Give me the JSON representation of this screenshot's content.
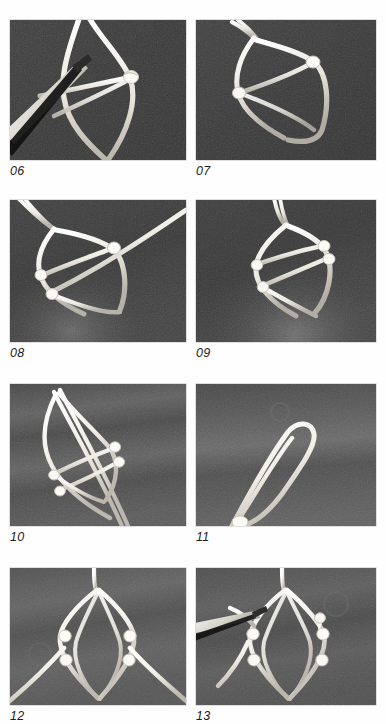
{
  "plate": {
    "kind": "photographic-instruction-plate",
    "layout": "2 columns x 4 rows",
    "background_color": "#ffffff",
    "caption_color": "#1c1c1c",
    "panel_border_color": "#2a2a2a"
  },
  "figures": [
    {
      "caption": "06",
      "row": 1,
      "column": "left",
      "background_tone": "#3a3a3a",
      "cord_color": "#f2f0ea",
      "description": "white cord formed into a pointed leaf loop, a pair of dark tweezers entering from lower left holding a strand, single knot at right side",
      "has_tool": true,
      "knot_count": 1
    },
    {
      "caption": "07",
      "row": 1,
      "column": "right",
      "background_tone": "#3c3c3c",
      "cord_color": "#efece4",
      "description": "leaf shaped cord loop with a diagonal cross cord running between an upper right knot and a lower left knot",
      "has_tool": false,
      "knot_count": 2
    },
    {
      "caption": "08",
      "row": 2,
      "column": "left",
      "background_tone": "#3a3a3a",
      "cord_color": "#f4f2ec",
      "description": "loop with two cross cords meeting at knots, a long working end sweeping out to the upper right corner",
      "has_tool": false,
      "knot_count": 3
    },
    {
      "caption": "09",
      "row": 2,
      "column": "right",
      "background_tone": "#3b3b3b",
      "cord_color": "#f1eee7",
      "description": "loop with two parallel diagonal cross cords forming a ladder, four small knots along the edges",
      "has_tool": false,
      "knot_count": 4
    },
    {
      "caption": "10",
      "row": 3,
      "column": "left",
      "background_tone": "#4a4a4a",
      "cord_color": "#f5f3ee",
      "description": "the netted loop tilted diagonally with a straight double core cord running through it, mottled light banded backdrop",
      "has_tool": false,
      "knot_count": 4
    },
    {
      "caption": "11",
      "row": 3,
      "column": "right",
      "background_tone": "#4c4c4c",
      "cord_color": "#f6f4ef",
      "description": "a simple narrow cord bight pointing up to the right, knot gathered at the lower left end",
      "has_tool": false,
      "knot_count": 1
    },
    {
      "caption": "12",
      "row": 4,
      "column": "left",
      "background_tone": "#4a4a4a",
      "cord_color": "#f6f4ef",
      "description": "symmetric finished net: pointed oval of cord with two horizontal rungs between four knots, working ends spreading to lower left and lower right",
      "has_tool": false,
      "knot_count": 4
    },
    {
      "caption": "13",
      "row": 4,
      "column": "right",
      "background_tone": "#474747",
      "cord_color": "#f4f2ec",
      "description": "same symmetric net with tweezers entering from the left to pull a strand through the upper left knot",
      "has_tool": true,
      "knot_count": 4
    }
  ]
}
